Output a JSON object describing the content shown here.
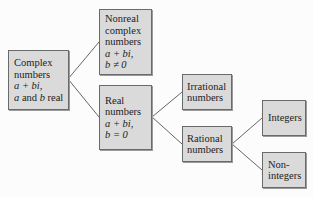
{
  "diagram": {
    "type": "tree",
    "colors": {
      "box_fill": "#dadada",
      "box_border": "#6a6a6a",
      "line": "#555555",
      "background": "#fcfcfc"
    },
    "nodes": {
      "complex": {
        "line1": "Complex",
        "line2": "numbers",
        "line3": "a + bi,",
        "line4_a": "a",
        "line4_mid": " and ",
        "line4_b": "b",
        "line4_end": " real"
      },
      "nonreal": {
        "line1": "Nonreal",
        "line2": "complex",
        "line3": "numbers",
        "line4": "a + bi,",
        "line5": "b ≠ 0"
      },
      "real": {
        "line1": "Real",
        "line2": "numbers",
        "line3": "a + bi,",
        "line4": "b = 0"
      },
      "irrational": {
        "line1": "Irrational",
        "line2": "numbers"
      },
      "rational": {
        "line1": "Rational",
        "line2": "numbers"
      },
      "integers": {
        "line1": "Integers"
      },
      "nonintegers": {
        "line1": "Non-",
        "line2": "integers"
      }
    },
    "edges": [
      [
        "complex",
        "nonreal"
      ],
      [
        "complex",
        "real"
      ],
      [
        "real",
        "irrational"
      ],
      [
        "real",
        "rational"
      ],
      [
        "rational",
        "integers"
      ],
      [
        "rational",
        "nonintegers"
      ]
    ]
  }
}
